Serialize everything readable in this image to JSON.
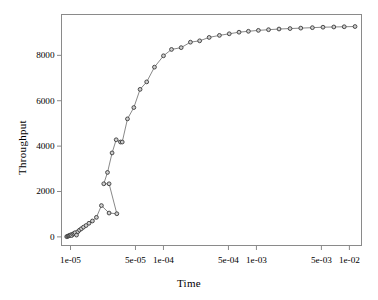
{
  "chart_data": {
    "type": "line",
    "title": "",
    "xlabel": "Time",
    "ylabel": "Throughput",
    "xscale": "log",
    "yscale": "linear",
    "xlim": [
      8e-06,
      0.0135
    ],
    "ylim": [
      -380,
      9800
    ],
    "grid": false,
    "legend": "none",
    "marker": "circle-open",
    "line_color": "#7a7a7a",
    "marker_edge_color": "#3a3a3a",
    "marker_face_color": "#cfcfcf",
    "xticks": [
      1e-05,
      5e-05,
      0.0001,
      0.0005,
      0.001,
      0.005,
      0.01
    ],
    "xticklabels": [
      "1e-05",
      "5e-05",
      "1e-04",
      "5e-04",
      "1e-03",
      "5e-03",
      "1e-02"
    ],
    "yticks": [
      0,
      2000,
      4000,
      6000,
      8000
    ],
    "yticklabels": [
      "0",
      "2000",
      "4000",
      "6000",
      "8000"
    ],
    "series": [
      {
        "name": "throughput-vs-time",
        "x": [
          9.1e-06,
          9.3e-06,
          9.5e-06,
          9.7e-06,
          9.9e-06,
          1.01e-05,
          1.03e-05,
          1.06e-05,
          1.09e-05,
          1.12e-05,
          1.16e-05,
          1.2e-05,
          1.25e-05,
          1.31e-05,
          1.38e-05,
          1.47e-05,
          1.58e-05,
          1.72e-05,
          1.9e-05,
          2.15e-05,
          2.6e-05,
          3.15e-05,
          2.6e-05,
          2.28e-05,
          2.5e-05,
          2.8e-05,
          3.1e-05,
          3.45e-05,
          3.6e-05,
          4.1e-05,
          4.8e-05,
          5.6e-05,
          6.6e-05,
          8e-05,
          0.0001,
          0.000122,
          0.000155,
          0.000195,
          0.000245,
          0.00031,
          0.0004,
          0.00051,
          0.00065,
          0.00082,
          0.00105,
          0.00135,
          0.00175,
          0.0023,
          0.003,
          0.004,
          0.0052,
          0.0068,
          0.0088,
          0.0115
        ],
        "y": [
          10,
          25,
          40,
          55,
          70,
          95,
          60,
          120,
          150,
          185,
          80,
          230,
          300,
          360,
          430,
          500,
          600,
          700,
          860,
          1380,
          1050,
          1020,
          2340,
          2340,
          2840,
          3700,
          4280,
          4180,
          4180,
          5200,
          5700,
          6500,
          6830,
          7480,
          7980,
          8260,
          8340,
          8580,
          8640,
          8790,
          8880,
          8950,
          9020,
          9060,
          9100,
          9130,
          9160,
          9180,
          9200,
          9220,
          9240,
          9250,
          9260,
          9270
        ]
      }
    ]
  },
  "axis_titles": {
    "x": "Time",
    "y": "Throughput"
  }
}
